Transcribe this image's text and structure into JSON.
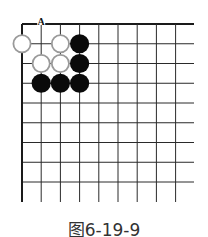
{
  "diagram": {
    "type": "go-board-problem",
    "caption": "图6-19-9",
    "board": {
      "origin": {
        "x": 22,
        "y": 24
      },
      "col_spacing": 19.2,
      "row_spacing": 19.75,
      "visible_cols": 9,
      "visible_rows": 9,
      "edges": [
        "top",
        "left"
      ],
      "line_extend_right": 194,
      "line_extend_bottom": 202,
      "line_color": "#2a2a2a",
      "edge_color": "#1a1a1a"
    },
    "stones": [
      {
        "color": "white",
        "col": 0,
        "row": 1
      },
      {
        "color": "white",
        "col": 2,
        "row": 1
      },
      {
        "color": "white",
        "col": 1,
        "row": 2
      },
      {
        "color": "white",
        "col": 2,
        "row": 2
      },
      {
        "color": "black",
        "col": 3,
        "row": 1
      },
      {
        "color": "black",
        "col": 3,
        "row": 2
      },
      {
        "color": "black",
        "col": 1,
        "row": 3
      },
      {
        "color": "black",
        "col": 2,
        "row": 3
      },
      {
        "color": "black",
        "col": 3,
        "row": 3
      }
    ],
    "labels": [
      {
        "text": "A",
        "col": 1,
        "row": 0
      }
    ],
    "colors": {
      "black_stone": "#0a0a0a",
      "white_stone_fill": "#ffffff",
      "white_stone_border": "#9a9a9a"
    }
  }
}
